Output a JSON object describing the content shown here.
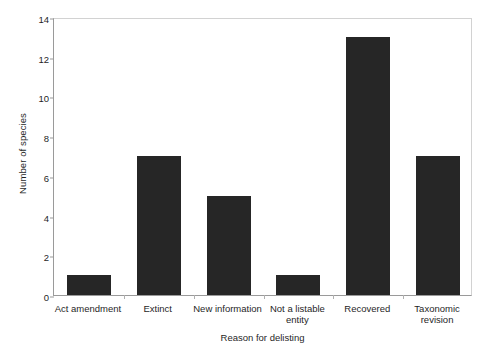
{
  "chart_data": {
    "type": "bar",
    "title": "",
    "xlabel": "Reason for delisting",
    "ylabel": "Number of species",
    "categories": [
      "Act amendment",
      "Extinct",
      "New information",
      "Not a listable entity",
      "Recovered",
      "Taxonomic revision"
    ],
    "values": [
      1,
      7,
      5,
      1,
      13,
      7
    ],
    "ylim": [
      0,
      14
    ],
    "yticks": [
      0,
      2,
      4,
      6,
      8,
      10,
      12,
      14
    ],
    "ytick_labels": [
      "0",
      "2",
      "4",
      "6",
      "8",
      "10",
      "12",
      "14"
    ],
    "grid": false,
    "legend": null,
    "bar_color": "#262626",
    "axis_color": "#9a9a9a",
    "frame_color": "#d2d2d2",
    "background": "#ffffff"
  }
}
